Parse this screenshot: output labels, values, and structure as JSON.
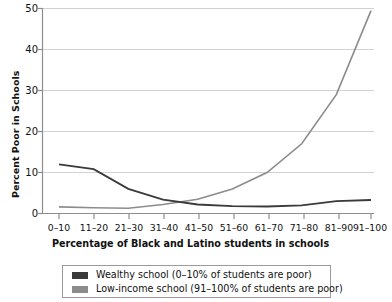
{
  "chart_data": {
    "type": "line",
    "title": "",
    "xlabel": "Percentage of Black and Latino students in schools",
    "ylabel": "Percent Poor in Schools",
    "categories": [
      "0–10",
      "11–20",
      "21–30",
      "31–40",
      "41–50",
      "51–60",
      "61–70",
      "71–80",
      "81–90",
      "91–100"
    ],
    "ylim": [
      0,
      50
    ],
    "yticks": [
      0,
      10,
      20,
      30,
      40,
      50
    ],
    "grid": "horizontal",
    "legend_position": "below",
    "series": [
      {
        "name": "Wealthy school (0–10% of students are poor)",
        "color": "#3a3a3a",
        "values": [
          12.0,
          10.8,
          6.0,
          3.4,
          2.2,
          1.8,
          1.7,
          2.0,
          3.0,
          3.3
        ]
      },
      {
        "name": "Low-income school (91–100% of students are poor)",
        "color": "#8c8c8c",
        "values": [
          1.6,
          1.4,
          1.3,
          1.4,
          1.6,
          1.7,
          1.8,
          2.4,
          1.7,
          1.6
        ]
      }
    ],
    "series_upper_right": {
      "name": "Low-income school rising curve",
      "values": [
        1.6,
        1.4,
        1.3,
        2.2,
        3.5,
        6.0,
        10.0,
        17.0,
        29.0,
        49.5
      ]
    }
  },
  "axis": {
    "y_tick_labels": [
      "0",
      "10",
      "20",
      "30",
      "40",
      "50"
    ],
    "x_tick_labels": [
      "0–10",
      "11–20",
      "21–30",
      "31–40",
      "41–50",
      "51–60",
      "61–70",
      "71–80",
      "81–90",
      "91–100"
    ]
  },
  "legend": {
    "items": [
      {
        "label": "Wealthy school (0–10% of students are poor)",
        "color": "#3a3a3a"
      },
      {
        "label": "Low-income school (91–100% of students are poor)",
        "color": "#8c8c8c"
      }
    ]
  },
  "colors": {
    "wealthy": "#3a3a3a",
    "low_income": "#8c8c8c",
    "grid": "#d2d2d2",
    "axis": "#8e8e8e",
    "background": "#ffffff"
  }
}
